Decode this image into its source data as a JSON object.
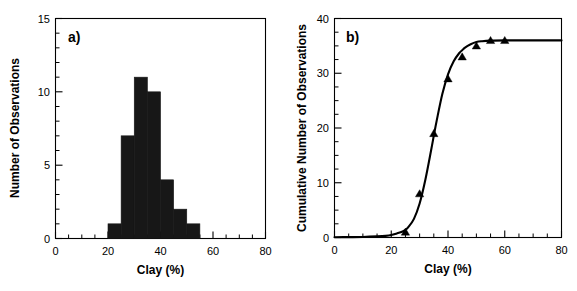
{
  "figure": {
    "background": "#ffffff",
    "foreground": "#000000",
    "series_color": "#171717"
  },
  "panels": [
    {
      "id": "a",
      "label": "a)",
      "xlabel": "Clay (%)",
      "ylabel": "Number of Observations"
    },
    {
      "id": "b",
      "label": "b)",
      "xlabel": "Clay (%)",
      "ylabel": "Cumulative Number of Observations"
    }
  ],
  "axis_labels": {
    "a_x": [
      "0",
      "20",
      "40",
      "60",
      "80"
    ],
    "a_y": [
      "0",
      "5",
      "10",
      "15"
    ],
    "b_x": [
      "0",
      "20",
      "40",
      "60",
      "80"
    ],
    "b_y": [
      "0",
      "10",
      "20",
      "30",
      "40"
    ]
  },
  "chart_data": [
    {
      "type": "bar",
      "panel": "a",
      "title": "a)",
      "xlabel": "Clay (%)",
      "ylabel": "Number of Observations",
      "xlim": [
        0,
        80
      ],
      "ylim": [
        0,
        15
      ],
      "xticks": [
        0,
        20,
        40,
        60,
        80
      ],
      "yticks": [
        0,
        5,
        10,
        15
      ],
      "xminor_step": 5,
      "yminor_step": 1,
      "grid": false,
      "legend": "none",
      "bin_width": 5,
      "bin_edges": [
        20,
        25,
        30,
        35,
        40,
        45,
        50,
        55
      ],
      "categories": [
        "20-25",
        "25-30",
        "30-35",
        "35-40",
        "40-45",
        "45-50",
        "50-55"
      ],
      "values": [
        1,
        7,
        11,
        10,
        4,
        2,
        1
      ],
      "bar_color": "#171717",
      "total_observations": 36
    },
    {
      "type": "line",
      "panel": "b",
      "title": "b)",
      "xlabel": "Clay (%)",
      "ylabel": "Cumulative Number of Observations",
      "xlim": [
        0,
        80
      ],
      "ylim": [
        0,
        40
      ],
      "xticks": [
        0,
        20,
        40,
        60,
        80
      ],
      "yticks": [
        0,
        10,
        20,
        30,
        40
      ],
      "xminor_step": 5,
      "yminor_step": 2.5,
      "grid": false,
      "legend": "none",
      "marker": "triangle-up",
      "marker_color": "#000000",
      "line_color": "#000000",
      "series": [
        {
          "name": "Cumulative observations",
          "x": [
            25,
            30,
            35,
            40,
            45,
            50,
            55,
            60
          ],
          "values": [
            1,
            8,
            19,
            29,
            33,
            35,
            36,
            36
          ]
        },
        {
          "name": "Fitted sigmoid",
          "type": "fit",
          "x": [
            0,
            5,
            10,
            15,
            18,
            20,
            22,
            24,
            25,
            26,
            28,
            30,
            32,
            34,
            35,
            36,
            38,
            40,
            42,
            44,
            45,
            46,
            48,
            50,
            52,
            55,
            60,
            65,
            70,
            75,
            80
          ],
          "values": [
            0.05,
            0.07,
            0.1,
            0.2,
            0.3,
            0.45,
            0.75,
            1.1,
            1.4,
            1.9,
            3.4,
            6.2,
            10.5,
            15.8,
            18.6,
            21.3,
            26.2,
            29.8,
            32.2,
            33.7,
            34.2,
            34.7,
            35.3,
            35.7,
            35.85,
            35.95,
            36.0,
            36.0,
            36.0,
            36.0,
            36.0
          ]
        }
      ]
    }
  ]
}
